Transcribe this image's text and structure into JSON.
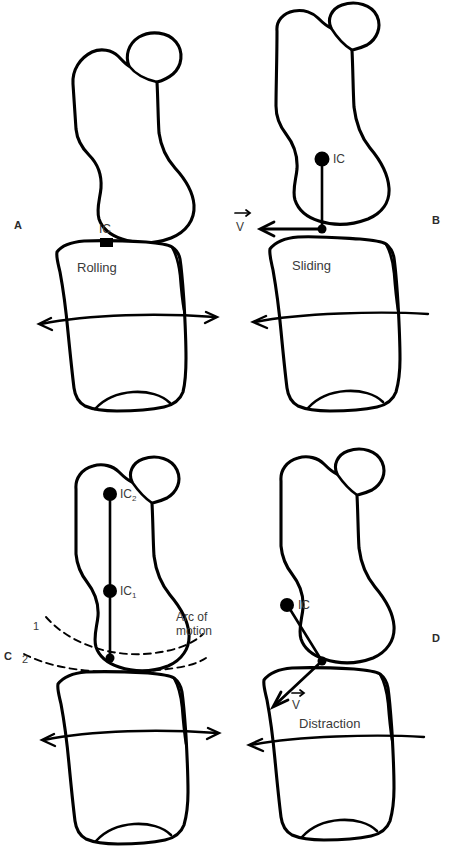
{
  "figure": {
    "panels": [
      {
        "id": "A",
        "letter": "A",
        "motion_label": "Rolling",
        "ic_label": "IC",
        "ic_marker": "square",
        "ic_location": "at joint contact point",
        "motion_arrow": "double-headed horizontal",
        "velocity_label": null
      },
      {
        "id": "B",
        "letter": "B",
        "motion_label": "Sliding",
        "ic_label": "IC",
        "ic_marker": "circle",
        "ic_location": "within distal femur, vertical line to contact point",
        "motion_arrow": "single-headed left",
        "velocity_label": "V",
        "velocity_direction": "horizontal left, tangent to joint surface"
      },
      {
        "id": "C",
        "letter": "C",
        "motion_label": "",
        "ic_labels": [
          "IC₂",
          "IC₁"
        ],
        "ic_label_1_base": "IC",
        "ic_label_1_sub": "1",
        "ic_label_2_base": "IC",
        "ic_label_2_sub": "2",
        "arc_label": "Arc of motion",
        "arc_numbers": [
          "1",
          "2"
        ],
        "motion_arrow": "double-headed horizontal",
        "velocity_label": null
      },
      {
        "id": "D",
        "letter": "D",
        "motion_label": "Distraction",
        "ic_label": "IC",
        "ic_marker": "circle",
        "ic_location": "medial distal femur, oblique line to contact point",
        "motion_arrow": "single-headed left",
        "velocity_label": "V",
        "velocity_direction": "oblique down-left, away from joint surface"
      }
    ],
    "colors": {
      "background": "#ffffff",
      "outline": "#000000",
      "label_text": "#3a3a3a",
      "panel_letter": "#2b2b2b"
    }
  }
}
